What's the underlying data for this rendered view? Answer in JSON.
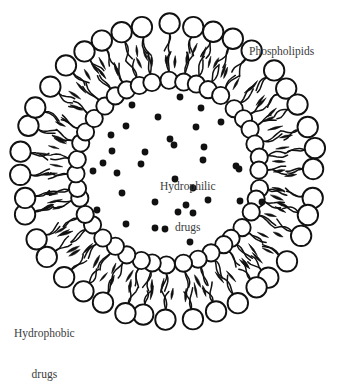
{
  "figure": {
    "type": "liposome-cross-section-diagram",
    "background_color": "#ffffff",
    "stroke_color": "#111111",
    "fill_color": "#ffffff",
    "text_color": "#3b3b3b",
    "center": {
      "x": 168,
      "y": 172
    },
    "geometry": {
      "outer_head_ring_radius": 147,
      "outer_head_radius": 10.2,
      "inner_head_ring_radius": 92,
      "inner_head_radius": 8.6,
      "outer_head_count": 40,
      "inner_head_count": 40,
      "tail_count_per_head": 2,
      "aqueous_core_radius": 84
    }
  },
  "labels": {
    "phospholipids": "Phospholipids",
    "hydrophobic_line1": "Hydrophobic",
    "hydrophobic_line2": "drugs",
    "hydrophilic_line1": "Hydrophilic",
    "hydrophilic_line2": "drugs"
  },
  "chart_data": {
    "type": "scatter",
    "title": "",
    "xlabel": "",
    "ylabel": "",
    "legend": [
      "Phospholipids",
      "Hydrophilic drugs",
      "Hydrophobic drugs"
    ],
    "annotations": [
      {
        "text": "Phospholipids",
        "x": 249,
        "y": 24,
        "align": "left"
      },
      {
        "text": "Hydrophilic drugs",
        "x": 196,
        "y": 166,
        "align": "center"
      },
      {
        "text": "Hydrophobic drugs",
        "x": 54,
        "y": 312,
        "align": "center"
      }
    ],
    "series": [
      {
        "name": "Hydrophilic drugs",
        "marker": "filled-circle",
        "color": "#111111",
        "radius": 3.4,
        "count": 34,
        "points": [
          {
            "x": 180,
            "y": 97
          },
          {
            "x": 132,
            "y": 105
          },
          {
            "x": 201,
            "y": 108
          },
          {
            "x": 158,
            "y": 117
          },
          {
            "x": 126,
            "y": 126
          },
          {
            "x": 111,
            "y": 135
          },
          {
            "x": 196,
            "y": 127
          },
          {
            "x": 221,
            "y": 122
          },
          {
            "x": 170,
            "y": 139
          },
          {
            "x": 112,
            "y": 151
          },
          {
            "x": 145,
            "y": 152
          },
          {
            "x": 174,
            "y": 145
          },
          {
            "x": 204,
            "y": 147
          },
          {
            "x": 203,
            "y": 160
          },
          {
            "x": 103,
            "y": 163
          },
          {
            "x": 141,
            "y": 164
          },
          {
            "x": 93,
            "y": 171
          },
          {
            "x": 117,
            "y": 173
          },
          {
            "x": 236,
            "y": 166
          },
          {
            "x": 239,
            "y": 169
          },
          {
            "x": 175,
            "y": 179
          },
          {
            "x": 193,
            "y": 188
          },
          {
            "x": 122,
            "y": 193
          },
          {
            "x": 155,
            "y": 202
          },
          {
            "x": 97,
            "y": 210
          },
          {
            "x": 186,
            "y": 205
          },
          {
            "x": 208,
            "y": 200
          },
          {
            "x": 240,
            "y": 201
          },
          {
            "x": 262,
            "y": 202
          },
          {
            "x": 178,
            "y": 212
          },
          {
            "x": 193,
            "y": 213
          },
          {
            "x": 126,
            "y": 224
          },
          {
            "x": 155,
            "y": 228
          },
          {
            "x": 165,
            "y": 229
          },
          {
            "x": 190,
            "y": 242
          }
        ]
      },
      {
        "name": "Hydrophobic drugs",
        "marker": "filled-lens",
        "color": "#111111",
        "description": "dark elongated lens shapes embedded radially within the hydrophobic tail region between the two phospholipid head rings",
        "count": 80
      }
    ]
  }
}
